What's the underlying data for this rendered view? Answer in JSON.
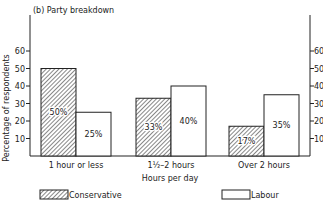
{
  "chart_data": {
    "type": "bar",
    "title": "(b) Party breakdown",
    "xlabel": "Hours per day",
    "ylabel": "Percentage of respondents",
    "ylim": [
      0,
      70
    ],
    "yticks": [
      10,
      20,
      30,
      40,
      50,
      60
    ],
    "grid": false,
    "legend_position": "bottom",
    "categories": [
      "1 hour or less",
      "1½–2 hours",
      "Over 2 hours"
    ],
    "series": [
      {
        "name": "Conservative",
        "pattern": "hatched",
        "values": [
          50,
          33,
          17
        ],
        "labels": [
          "50%",
          "33%",
          "17%"
        ]
      },
      {
        "name": "Labour",
        "pattern": "white",
        "values": [
          25,
          40,
          35
        ],
        "labels": [
          "25%",
          "40%",
          "35%"
        ]
      }
    ]
  }
}
